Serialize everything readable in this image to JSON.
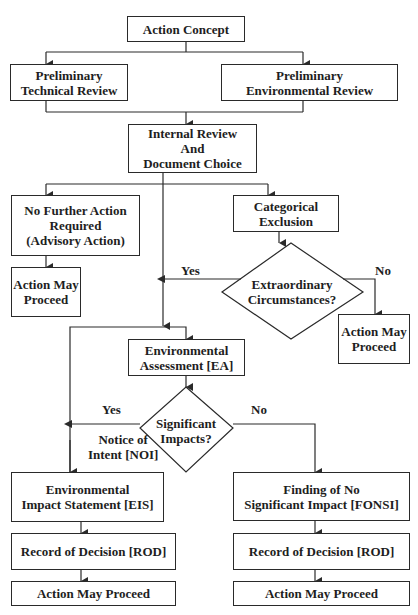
{
  "nodes": {
    "action_concept": {
      "lines": [
        "Action Concept"
      ]
    },
    "prelim_technical": {
      "lines": [
        "Preliminary",
        "Technical Review"
      ]
    },
    "prelim_environmental": {
      "lines": [
        "Preliminary",
        "Environmental Review"
      ]
    },
    "internal_review": {
      "lines": [
        "Internal Review",
        "And",
        "Document Choice"
      ]
    },
    "no_further_action": {
      "lines": [
        "No Further Action",
        "Required",
        "(Advisory Action)"
      ]
    },
    "action_proceed_advisory": {
      "lines": [
        "Action May",
        "Proceed"
      ]
    },
    "categorical_exclusion": {
      "lines": [
        "Categorical",
        "Exclusion"
      ]
    },
    "extraordinary_decision": {
      "lines": [
        "Extraordinary",
        "Circumstances?"
      ]
    },
    "action_proceed_catex": {
      "lines": [
        "Action May",
        "Proceed"
      ]
    },
    "environmental_assessment": {
      "lines": [
        "Environmental",
        "Assessment [EA]"
      ]
    },
    "significant_decision": {
      "lines": [
        "Significant",
        "Impacts?"
      ]
    },
    "eis": {
      "lines": [
        "Environmental",
        "Impact Statement [EIS]"
      ]
    },
    "fonsi": {
      "lines": [
        "Finding of No",
        "Significant Impact [FONSI]"
      ]
    },
    "rod_left": {
      "lines": [
        "Record of Decision [ROD]"
      ]
    },
    "rod_right": {
      "lines": [
        "Record of Decision [ROD]"
      ]
    },
    "action_proceed_eis": {
      "lines": [
        "Action May Proceed"
      ]
    },
    "action_proceed_fonsi": {
      "lines": [
        "Action May Proceed"
      ]
    }
  },
  "edge_labels": {
    "extraordinary_yes": "Yes",
    "extraordinary_no": "No",
    "significant_yes": "Yes",
    "significant_no": "No",
    "noi": [
      "Notice of",
      "Intent [NOI]"
    ]
  },
  "colors": {
    "line": "#2a2a2a",
    "text": "#1e1e1e",
    "background": "#ffffff"
  }
}
